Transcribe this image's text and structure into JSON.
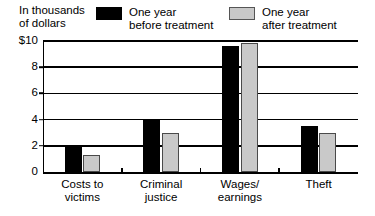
{
  "chart_data": {
    "type": "bar",
    "title": "",
    "subtitle": "",
    "xlabel": "",
    "ylabel": "In thousands of dollars",
    "categories": [
      "Costs to victims",
      "Criminal justice",
      "Wages/ earnings",
      "Theft"
    ],
    "category_lines": [
      [
        "Costs to",
        "victims"
      ],
      [
        "Criminal",
        "justice"
      ],
      [
        "Wages/",
        "earnings"
      ],
      [
        "Theft"
      ]
    ],
    "series": [
      {
        "name": "One year before treatment",
        "color": "#000000",
        "values": [
          2.0,
          4.0,
          9.6,
          3.5
        ]
      },
      {
        "name": "One year after treatment",
        "color": "#c9c9c9",
        "values": [
          1.3,
          3.0,
          9.85,
          3.0
        ]
      }
    ],
    "ylim": [
      0,
      10
    ],
    "yticks": [
      0,
      2,
      4,
      6,
      8,
      10
    ],
    "ytick_labels": [
      "0",
      "2",
      "4",
      "6",
      "8",
      "$10"
    ],
    "grid": true,
    "legend_position": "top"
  },
  "axis_caption": {
    "line1": "In thousands",
    "line2": "of dollars"
  },
  "legend": {
    "before": {
      "line1": "One year",
      "line2": "before treatment",
      "swatch": "black-square-swatch"
    },
    "after": {
      "line1": "One year",
      "line2": "after treatment",
      "swatch": "gray-square-swatch"
    }
  }
}
